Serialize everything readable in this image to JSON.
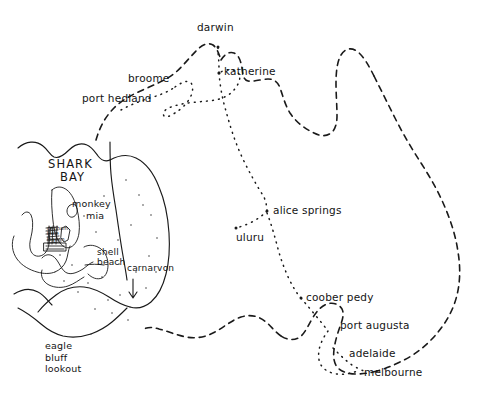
{
  "map": {
    "title": "hand-drawn sketch map of australia with shark bay inset",
    "ink_color": "#1a1a1a",
    "background_color": "#ffffff",
    "coastline_style": "dashed",
    "route_style": "dotted",
    "inset_style": "solid"
  },
  "cities": [
    {
      "name": "darwin",
      "label": "darwin",
      "x": 197,
      "y": 28,
      "marker": true,
      "marker_x": 218,
      "marker_y": 47
    },
    {
      "name": "katherine",
      "label": "katherine",
      "x": 224,
      "y": 68,
      "marker": true,
      "marker_x": 219,
      "marker_y": 73
    },
    {
      "name": "broome",
      "label": "broome",
      "x": 127,
      "y": 78,
      "marker": false
    },
    {
      "name": "port-hedland",
      "label": "port hedland",
      "x": 83,
      "y": 97,
      "marker": false
    },
    {
      "name": "alice-springs",
      "label": "alice springs",
      "x": 272,
      "y": 205,
      "marker": true,
      "marker_x": 267,
      "marker_y": 211
    },
    {
      "name": "uluru",
      "label": "uluru",
      "x": 236,
      "y": 231,
      "marker": false
    },
    {
      "name": "coober-pedy",
      "label": "coober pedy",
      "x": 305,
      "y": 292,
      "marker": true,
      "marker_x": 301,
      "marker_y": 298
    },
    {
      "name": "port-augusta",
      "label": "port augusta",
      "x": 340,
      "y": 320,
      "marker": false
    },
    {
      "name": "adelaide",
      "label": "adelaide",
      "x": 348,
      "y": 348,
      "marker": false
    },
    {
      "name": "melbourne",
      "label": "melbourne",
      "x": 364,
      "y": 367,
      "marker": false
    }
  ],
  "regions": [
    {
      "name": "shark-bay",
      "line1": "SHARK",
      "line2": "BAY",
      "x": 48,
      "y": 162
    }
  ],
  "inset_places": [
    {
      "name": "monkey-mia",
      "line1": "monkey",
      "line2": "mia",
      "x": 72,
      "y": 200
    },
    {
      "name": "shell-beach",
      "line1": "shell",
      "line2": "beach",
      "x": 96,
      "y": 251
    },
    {
      "name": "carnarvon",
      "label": "carnarvon",
      "x": 127,
      "y": 266
    },
    {
      "name": "denham-cluster",
      "line1": "denham",
      "line2": "little",
      "line3": "lagoon",
      "x": 49,
      "y": 228
    }
  ],
  "annotations": [
    {
      "name": "eagle-bluff-lookout",
      "line1": "eagle",
      "line2": "bluff",
      "line3": "lookout",
      "x": 45,
      "y": 341
    }
  ]
}
